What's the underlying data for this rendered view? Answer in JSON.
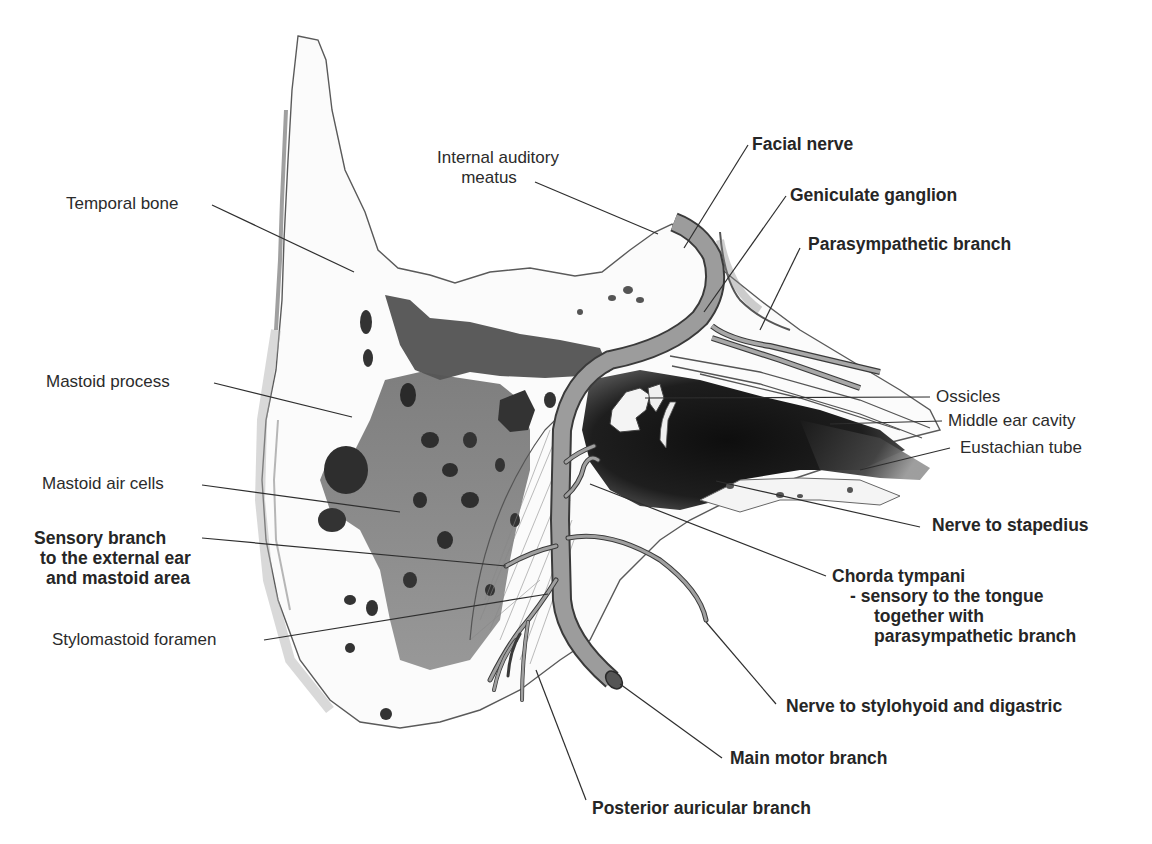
{
  "figure": {
    "colors": {
      "nerve_fill": "#9a9a9a",
      "nerve_edge": "#3a3a3a",
      "bone_outline": "#4a4a4a",
      "air_cells": "#3c3c3c",
      "cavity": "#1a1a1a",
      "leader_line": "#2e2e2e",
      "text": "#2b2b2b"
    }
  },
  "labels": {
    "temporal_bone": {
      "text": "Temporal bone",
      "weight": "normal"
    },
    "mastoid_process": {
      "text": "Mastoid process",
      "weight": "normal"
    },
    "mastoid_air_cells": {
      "text": "Mastoid air cells",
      "weight": "normal"
    },
    "sensory_branch": {
      "lines": [
        "Sensory branch",
        "to the external ear",
        "and mastoid area"
      ],
      "weight": "bold"
    },
    "stylomastoid_foramen": {
      "text": "Stylomastoid foramen",
      "weight": "normal"
    },
    "internal_auditory_meatus": {
      "lines": [
        "Internal auditory",
        "meatus"
      ],
      "weight": "normal"
    },
    "facial_nerve": {
      "text": "Facial nerve",
      "weight": "bold"
    },
    "geniculate_ganglion": {
      "text": "Geniculate ganglion",
      "weight": "bold"
    },
    "parasympathetic_branch": {
      "text": "Parasympathetic branch",
      "weight": "bold"
    },
    "ossicles": {
      "text": "Ossicles",
      "weight": "normal"
    },
    "middle_ear_cavity": {
      "text": "Middle ear cavity",
      "weight": "normal"
    },
    "eustachian_tube": {
      "text": "Eustachian tube",
      "weight": "normal"
    },
    "nerve_to_stapedius": {
      "text": "Nerve to stapedius",
      "weight": "bold"
    },
    "chorda_tympani": {
      "lines": [
        "Chorda tympani",
        "- sensory to the tongue",
        "together with",
        "parasympathetic branch"
      ],
      "weight": "bold"
    },
    "nerve_to_stylohyoid": {
      "text": "Nerve to stylohyoid and digastric",
      "weight": "bold"
    },
    "main_motor_branch": {
      "text": "Main motor branch",
      "weight": "bold"
    },
    "posterior_auricular_branch": {
      "text": "Posterior auricular branch",
      "weight": "bold"
    }
  }
}
